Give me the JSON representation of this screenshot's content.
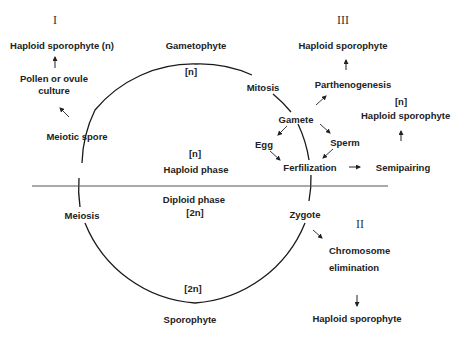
{
  "diagram": {
    "cycle": {
      "top_label": "Gametophyte",
      "top_ploidy": "[n]",
      "bottom_label": "Sporophyte",
      "bottom_ploidy": "[2n]",
      "left_upper": "Meiotic spore",
      "left_lower": "Meiosis",
      "right_upper": "Mitosis",
      "right_gamete": "Gamete",
      "right_fertilization": "Ferfilization",
      "right_lower": "Zygote"
    },
    "phases": {
      "haploid_ploidy": "[n]",
      "haploid_label": "Haploid phase",
      "diploid_label": "Diploid phase",
      "diploid_ploidy": "[2n]"
    },
    "gametes": {
      "egg": "Egg",
      "sperm": "Sperm"
    },
    "pathway_I": {
      "numeral": "I",
      "step1": "Pollen or ovule",
      "step1b": "culture",
      "result": "Haploid sporophyte (n)"
    },
    "pathway_II": {
      "numeral": "II",
      "step1": "Chromosome",
      "step1b": "elimination",
      "result": "Haploid sporophyte"
    },
    "pathway_III": {
      "numeral": "III",
      "parthenogenesis": "Parthenogenesis",
      "parthenogenesis_result": "Haploid sporophyte",
      "semipairing": "Semipairing",
      "semipairing_ploidy": "[n]",
      "semipairing_result": "Haploid sporophyte"
    },
    "colors": {
      "line": "#1a1a1a",
      "text": "#222222",
      "background": "#ffffff"
    }
  }
}
